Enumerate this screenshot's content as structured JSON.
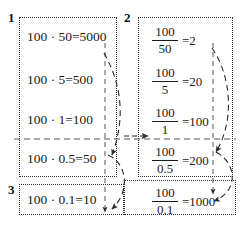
{
  "figure": {
    "groups": [
      {
        "number": "1",
        "kind": "multiplication",
        "rows": [
          {
            "left": "100",
            "op": "·",
            "right": "50",
            "eq": "=5000",
            "text": "100 · 50=5000"
          },
          {
            "left": "100",
            "op": "·",
            "right": "5",
            "eq": "=500",
            "text": "100 · 5=500"
          },
          {
            "left": "100",
            "op": "·",
            "right": "1",
            "eq": "=100",
            "text": "100 · 1=100"
          },
          {
            "left": "100",
            "op": "·",
            "right": "0.5",
            "eq": "=50",
            "text": "100 · 0.5=50"
          }
        ]
      },
      {
        "number": "2",
        "kind": "division",
        "rows": [
          {
            "numerator": "100",
            "denominator": "50",
            "eq": "=2"
          },
          {
            "numerator": "100",
            "denominator": "5",
            "eq": "=20"
          },
          {
            "numerator": "100",
            "denominator": "1",
            "eq": "=100"
          },
          {
            "numerator": "100",
            "denominator": "0.5",
            "eq": "=200"
          }
        ]
      },
      {
        "number": "3",
        "kind": "mixed",
        "mul_rows": [
          {
            "left": "100",
            "op": "·",
            "right": "0.1",
            "eq": "=10",
            "text": "100 · 0.1=10"
          }
        ],
        "div_rows": [
          {
            "numerator": "100",
            "denominator": "0.1",
            "eq": "=1000"
          }
        ]
      }
    ],
    "colors": {
      "ink": "#1a1a1a",
      "box_border": "#2b2b2b",
      "guide_line": "#555555",
      "arrow": "#333333",
      "background": "#ffffff"
    }
  }
}
